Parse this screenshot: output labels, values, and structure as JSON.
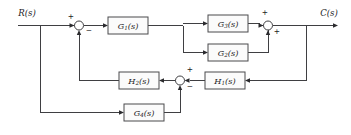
{
  "diagram": {
    "type": "control-system-block-diagram",
    "title": "",
    "background_color": "#ffffff",
    "line_color": "#3f3f42",
    "block_fill_color": "#fbfbfb",
    "block_stroke_color": "#4a4a4d",
    "text_color": "#1b1b1d",
    "io": {
      "input_label": "R(s)",
      "output_label": "C(s)"
    },
    "blocks": [
      {
        "id": "G1",
        "base": "G",
        "sub": "1",
        "suffix": "(s)",
        "label": "G₁(s)",
        "x": 108,
        "y": 17,
        "w": 40,
        "h": 17
      },
      {
        "id": "G3",
        "base": "G",
        "sub": "3",
        "suffix": "(s)",
        "label": "G₃(s)",
        "x": 208,
        "y": 15,
        "w": 40,
        "h": 17
      },
      {
        "id": "G2",
        "base": "G",
        "sub": "2",
        "suffix": "(s)",
        "label": "G₂(s)",
        "x": 208,
        "y": 44,
        "w": 40,
        "h": 17
      },
      {
        "id": "H2",
        "base": "H",
        "sub": "2",
        "suffix": "(s)",
        "label": "H₂(s)",
        "x": 119,
        "y": 72,
        "w": 40,
        "h": 17
      },
      {
        "id": "H1",
        "base": "H",
        "sub": "1",
        "suffix": "(s)",
        "label": "H₁(s)",
        "x": 205,
        "y": 72,
        "w": 40,
        "h": 17
      },
      {
        "id": "G4",
        "base": "G",
        "sub": "4",
        "suffix": "(s)",
        "label": "G₄(s)",
        "x": 124,
        "y": 104,
        "w": 40,
        "h": 17
      }
    ],
    "summing_junctions": [
      {
        "id": "sum-input",
        "cx": 79,
        "cy": 25.5,
        "r": 4.5,
        "signs": [
          {
            "text": "+",
            "x": 71,
            "y": 17
          },
          {
            "text": "−",
            "x": 89,
            "y": 31
          }
        ]
      },
      {
        "id": "sum-parallel",
        "cx": 268,
        "cy": 25.5,
        "r": 4.5,
        "signs": [
          {
            "text": "+",
            "x": 265,
            "y": 13
          },
          {
            "text": "+",
            "x": 277,
            "y": 32
          }
        ]
      },
      {
        "id": "sum-feedback",
        "cx": 180,
        "cy": 80.5,
        "r": 4.5,
        "signs": [
          {
            "text": "+",
            "x": 190,
            "y": 70
          },
          {
            "text": "−",
            "x": 190,
            "y": 87
          }
        ]
      }
    ]
  }
}
